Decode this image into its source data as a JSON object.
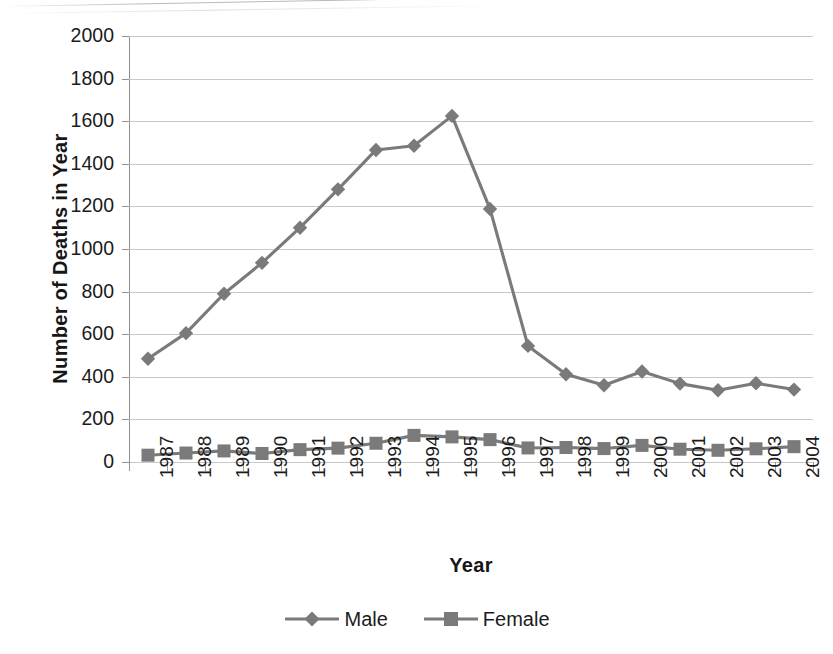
{
  "chart_data": {
    "type": "line",
    "title": "",
    "subtitle": "",
    "xlabel": "Year",
    "ylabel": "Number of Deaths in Year",
    "categories": [
      "1987",
      "1988",
      "1989",
      "1990",
      "1991",
      "1992",
      "1993",
      "1994",
      "1995",
      "1996",
      "1997",
      "1998",
      "1999",
      "2000",
      "2001",
      "2002",
      "2003",
      "2004"
    ],
    "x": [
      1987,
      1988,
      1989,
      1990,
      1991,
      1992,
      1993,
      1994,
      1995,
      1996,
      1997,
      1998,
      1999,
      2000,
      2001,
      2002,
      2003,
      2004
    ],
    "series": [
      {
        "name": "Male",
        "marker": "diamond",
        "color": "#7a7a7a",
        "values": [
          485,
          605,
          790,
          935,
          1100,
          1280,
          1465,
          1485,
          1625,
          1188,
          545,
          412,
          360,
          425,
          368,
          337,
          370,
          340
        ]
      },
      {
        "name": "Female",
        "marker": "square",
        "color": "#7a7a7a",
        "values": [
          32,
          42,
          52,
          40,
          58,
          65,
          88,
          125,
          118,
          105,
          66,
          68,
          63,
          78,
          60,
          55,
          62,
          72
        ]
      }
    ],
    "ylim": [
      0,
      2000
    ],
    "ytick_step": 200,
    "yticks": [
      2000,
      1800,
      1600,
      1400,
      1200,
      1000,
      800,
      600,
      400,
      200,
      0
    ],
    "ytick_labels": [
      "2000",
      "1800",
      "1600",
      "1400",
      "1200",
      "1000",
      "800",
      "600",
      "400",
      "200",
      "0"
    ],
    "grid": "horizontal",
    "legend_position": "bottom",
    "legend_entries": [
      "Male",
      "Female"
    ],
    "annotations": [],
    "colors": {
      "male_line": "#7a7a7a",
      "female_line": "#7a7a7a",
      "gridline": "#c9c9c9",
      "axis": "#8f8f8f",
      "text": "#1b1b1b",
      "background": "#ffffff"
    }
  }
}
